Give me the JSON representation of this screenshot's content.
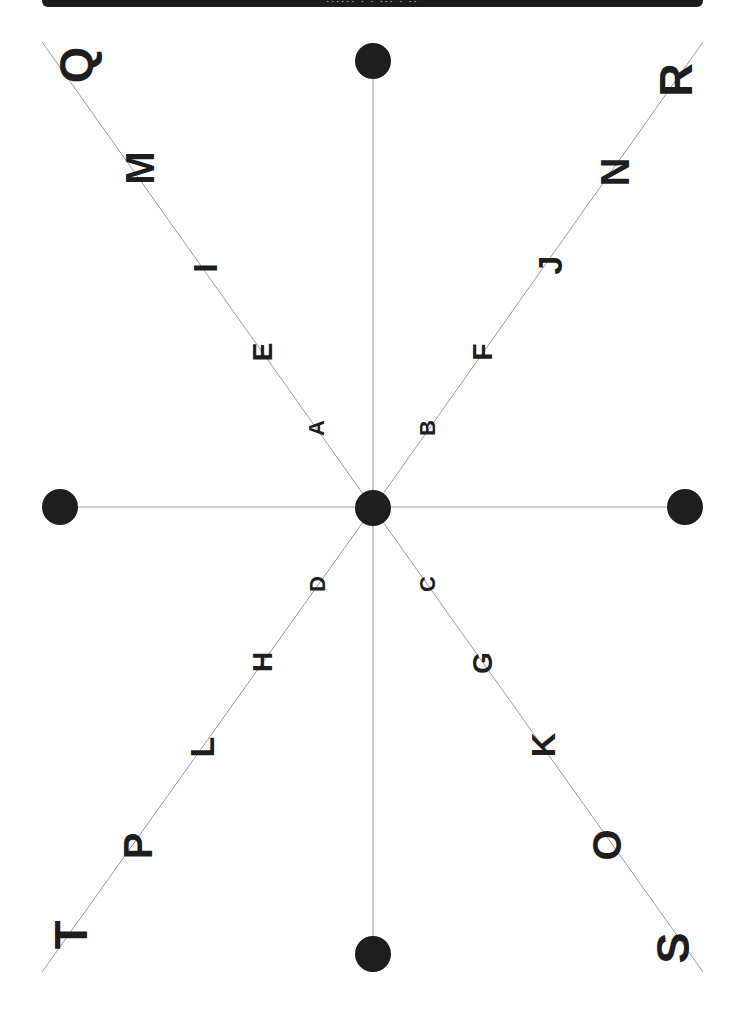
{
  "header": {
    "title": "······ · · ··· · ··"
  },
  "colors": {
    "background": "#ffffff",
    "line": "#9a9a9a",
    "dot": "#1e1e1e",
    "letter": "#1e1e1e",
    "topbar": "#1c1c1c"
  },
  "center": {
    "x": 373,
    "y": 508
  },
  "dots": [
    {
      "name": "center",
      "x": 373,
      "y": 508
    },
    {
      "name": "top",
      "x": 373,
      "y": 61
    },
    {
      "name": "bottom",
      "x": 373,
      "y": 954
    },
    {
      "name": "left",
      "x": 60,
      "y": 507
    },
    {
      "name": "right",
      "x": 685,
      "y": 507
    }
  ],
  "lines": [
    {
      "name": "vertical",
      "x1": 373,
      "y1": 61,
      "x2": 373,
      "y2": 954
    },
    {
      "name": "horizontal",
      "x1": 60,
      "y1": 507,
      "x2": 685,
      "y2": 507
    },
    {
      "name": "diag-upper-left",
      "x1": 373,
      "y1": 508,
      "x2": 42,
      "y2": 42
    },
    {
      "name": "diag-upper-right",
      "x1": 373,
      "y1": 508,
      "x2": 703,
      "y2": 42
    },
    {
      "name": "diag-lower-left",
      "x1": 373,
      "y1": 508,
      "x2": 42,
      "y2": 972
    },
    {
      "name": "diag-lower-right",
      "x1": 373,
      "y1": 508,
      "x2": 703,
      "y2": 972
    }
  ],
  "letters": [
    {
      "char": "A",
      "x": 317,
      "y": 428,
      "size": 22
    },
    {
      "char": "B",
      "x": 428,
      "y": 428,
      "size": 22
    },
    {
      "char": "C",
      "x": 428,
      "y": 584,
      "size": 22
    },
    {
      "char": "D",
      "x": 318,
      "y": 584,
      "size": 22
    },
    {
      "char": "E",
      "x": 263,
      "y": 352,
      "size": 28
    },
    {
      "char": "F",
      "x": 483,
      "y": 352,
      "size": 28
    },
    {
      "char": "G",
      "x": 483,
      "y": 663,
      "size": 28
    },
    {
      "char": "H",
      "x": 263,
      "y": 662,
      "size": 28
    },
    {
      "char": "I",
      "x": 205,
      "y": 268,
      "size": 34
    },
    {
      "char": "J",
      "x": 550,
      "y": 265,
      "size": 34
    },
    {
      "char": "K",
      "x": 543,
      "y": 745,
      "size": 34
    },
    {
      "char": "L",
      "x": 202,
      "y": 747,
      "size": 34
    },
    {
      "char": "M",
      "x": 140,
      "y": 168,
      "size": 40
    },
    {
      "char": "N",
      "x": 615,
      "y": 172,
      "size": 40
    },
    {
      "char": "O",
      "x": 607,
      "y": 845,
      "size": 40
    },
    {
      "char": "P",
      "x": 138,
      "y": 846,
      "size": 40
    },
    {
      "char": "Q",
      "x": 75,
      "y": 65,
      "size": 47
    },
    {
      "char": "R",
      "x": 675,
      "y": 80,
      "size": 47
    },
    {
      "char": "S",
      "x": 672,
      "y": 948,
      "size": 47
    },
    {
      "char": "T",
      "x": 70,
      "y": 935,
      "size": 47
    }
  ]
}
